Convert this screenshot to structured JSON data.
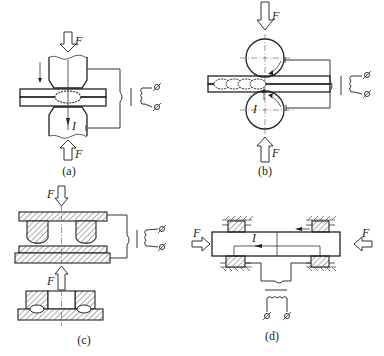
{
  "figure": {
    "panels": [
      {
        "id": "a",
        "caption": "(a)",
        "process": "spot welding",
        "force_label": "F",
        "current_label": "I"
      },
      {
        "id": "b",
        "caption": "(b)",
        "process": "seam welding",
        "force_label": "F",
        "current_label": "I"
      },
      {
        "id": "c",
        "caption": "(c)",
        "process": "projection welding",
        "force_label": "F"
      },
      {
        "id": "d",
        "caption": "(d)",
        "process": "butt welding",
        "force_label": "F",
        "current_label": "I"
      }
    ],
    "colors": {
      "line": "#333333",
      "background": "#ffffff"
    }
  }
}
